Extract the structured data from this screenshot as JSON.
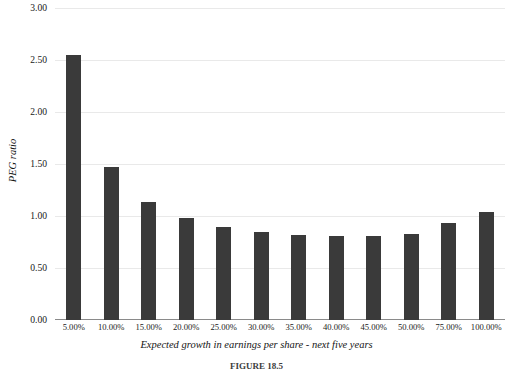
{
  "chart_data": {
    "type": "bar",
    "title": "",
    "xlabel": "Expected growth in earnings per share - next five years",
    "ylabel": "PEG ratio",
    "categories": [
      "5.00%",
      "10.00%",
      "15.00%",
      "20.00%",
      "25.00%",
      "30.00%",
      "35.00%",
      "40.00%",
      "45.00%",
      "50.00%",
      "75.00%",
      "100.00%"
    ],
    "values": [
      2.55,
      1.47,
      1.13,
      0.98,
      0.89,
      0.85,
      0.82,
      0.81,
      0.81,
      0.83,
      0.93,
      1.04
    ],
    "ylim": [
      0.0,
      3.0
    ],
    "ytick_labels": [
      "0.00",
      "0.50",
      "1.00",
      "1.50",
      "2.00",
      "2.50",
      "3.00"
    ],
    "ytick_values": [
      0.0,
      0.5,
      1.0,
      1.5,
      2.0,
      2.5,
      3.0
    ],
    "grid": true,
    "legend": false,
    "bar_color": "#3a3a3a",
    "grid_color": "#e9e9e9",
    "axis_color": "#8a8a8a"
  },
  "caption": {
    "label": "FIGURE 18.5",
    "text": ""
  }
}
